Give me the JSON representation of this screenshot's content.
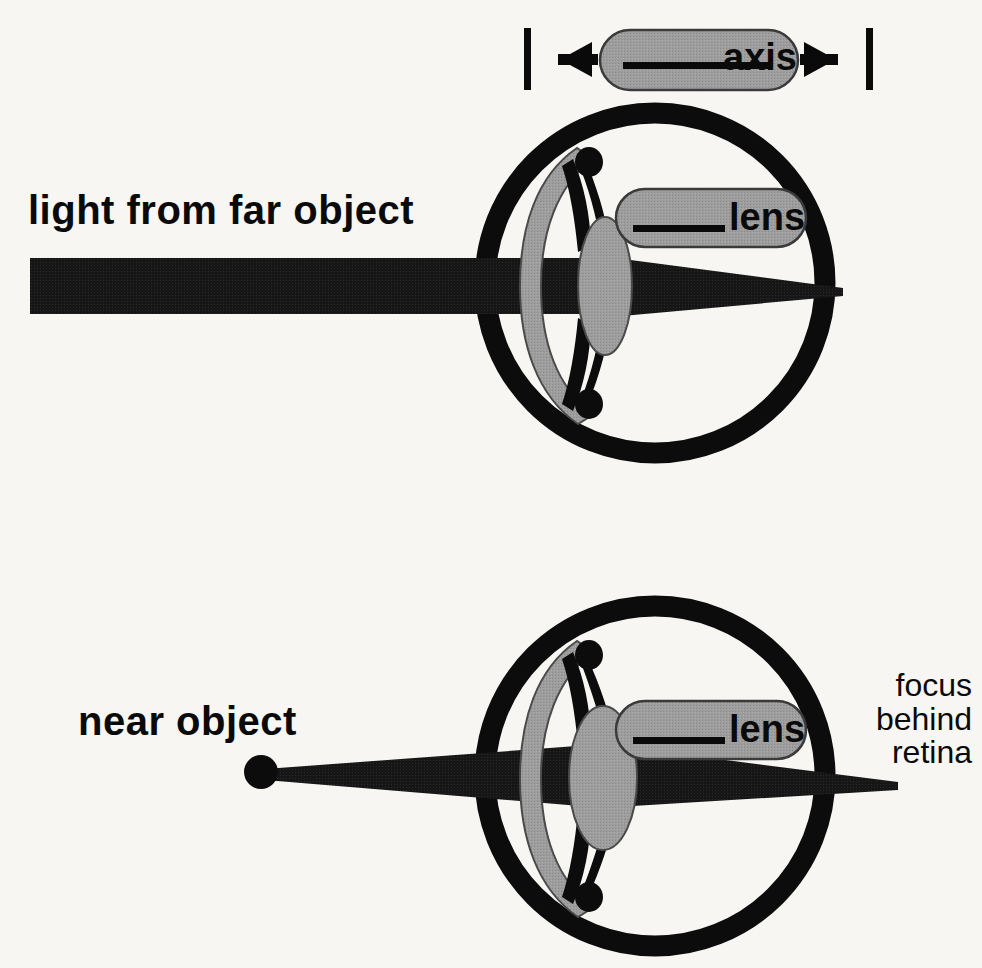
{
  "figure": {
    "width": 982,
    "height": 968,
    "background_color": "#f7f6f3",
    "ink_color": "#0a0a0a",
    "gray_fill_color": "#9a9a9a"
  },
  "labels": {
    "far_object": "light from far object",
    "near_object": "near object",
    "focus_behind_retina": "focus\nbehind\nretina"
  },
  "callouts": {
    "axis": {
      "text": "axis",
      "leader_line": true,
      "left_bracket": true,
      "left_arrow": true,
      "right_arrow": true,
      "right_bracket": true
    },
    "lens_top": {
      "text": "lens",
      "leader_line": true
    },
    "lens_bottom": {
      "text": "lens",
      "leader_line": true
    }
  },
  "diagrams": [
    {
      "name": "far-object-eye",
      "beam_type": "parallel-incoming",
      "focus_location": "on-retina",
      "lens_shape": "flat",
      "eye_center": [
        655,
        283
      ],
      "eye_radius": 170
    },
    {
      "name": "near-object-eye",
      "beam_type": "diverging-from-point",
      "focus_location": "behind-retina",
      "lens_shape": "round",
      "point_source": [
        261,
        772
      ],
      "eye_center": [
        655,
        776
      ],
      "eye_radius": 170
    }
  ]
}
